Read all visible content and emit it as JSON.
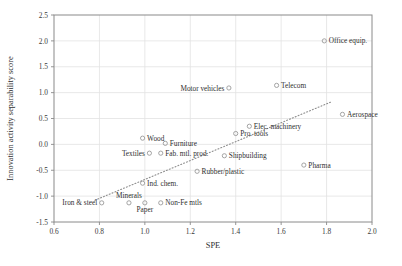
{
  "chart_data": {
    "type": "scatter",
    "title": "",
    "xlabel": "SPE",
    "ylabel": "Innovation activity separability score",
    "xlim": [
      0.6,
      2.0
    ],
    "ylim": [
      -1.5,
      2.5
    ],
    "xticks": [
      "0.6",
      "0.8",
      "1.0",
      "1.2",
      "1.4",
      "1.6",
      "1.8",
      "2.0"
    ],
    "xtick_values": [
      0.6,
      0.8,
      1.0,
      1.2,
      1.4,
      1.6,
      1.8,
      2.0
    ],
    "yticks": [
      "2.5",
      "2.0",
      "1.5",
      "1.0",
      "0.5",
      "0.0",
      "-0.5",
      "-1.0",
      "-1.5"
    ],
    "ytick_values": [
      2.5,
      2.0,
      1.5,
      1.0,
      0.5,
      0.0,
      -0.5,
      -1.0,
      -1.5
    ],
    "grid": true,
    "legend": "none",
    "marker_style": "open-circle",
    "trendline": {
      "style": "dotted",
      "x_start": 0.78,
      "y_start": -1.08,
      "x_end": 1.82,
      "y_end": 0.82
    },
    "points": [
      {
        "label": "Office equip.",
        "x": 1.79,
        "y": 2.0,
        "label_side": "right"
      },
      {
        "label": "Telecom",
        "x": 1.58,
        "y": 1.14,
        "label_side": "right"
      },
      {
        "label": "Motor vehicles",
        "x": 1.37,
        "y": 1.09,
        "label_side": "left"
      },
      {
        "label": "Aerospace",
        "x": 1.87,
        "y": 0.58,
        "label_side": "right"
      },
      {
        "label": "Elec. machinery",
        "x": 1.46,
        "y": 0.35,
        "label_side": "right"
      },
      {
        "label": "Pro. tools",
        "x": 1.4,
        "y": 0.21,
        "label_side": "right"
      },
      {
        "label": "Wood",
        "x": 0.99,
        "y": 0.12,
        "label_side": "right"
      },
      {
        "label": "Furniture",
        "x": 1.09,
        "y": 0.02,
        "label_side": "right"
      },
      {
        "label": "Textiles",
        "x": 1.02,
        "y": -0.17,
        "label_side": "left"
      },
      {
        "label": "Fab. mtl. prod.",
        "x": 1.07,
        "y": -0.17,
        "label_side": "right"
      },
      {
        "label": "Shipbuilding",
        "x": 1.35,
        "y": -0.22,
        "label_side": "right"
      },
      {
        "label": "Pharma",
        "x": 1.7,
        "y": -0.4,
        "label_side": "right"
      },
      {
        "label": "Rubber/plastic",
        "x": 1.23,
        "y": -0.52,
        "label_side": "right"
      },
      {
        "label": "Ind. chem.",
        "x": 0.99,
        "y": -0.75,
        "label_side": "right"
      },
      {
        "label": "Minerals",
        "x": 0.93,
        "y": -1.13,
        "label_side": "above"
      },
      {
        "label": "Iron & steel",
        "x": 0.81,
        "y": -1.13,
        "label_side": "left"
      },
      {
        "label": "Paper",
        "x": 1.0,
        "y": -1.13,
        "label_side": "below"
      },
      {
        "label": "Non-Fe mtls",
        "x": 1.07,
        "y": -1.13,
        "label_side": "right"
      }
    ]
  },
  "colors": {
    "background": "#ffffff",
    "axis": "#8a8a8a",
    "grid": "#e2e2e2",
    "marker": "#9a9a9a",
    "text": "#2f2f2f",
    "trendline": "#8d8d8d"
  }
}
